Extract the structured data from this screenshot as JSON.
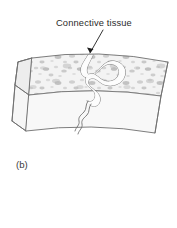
{
  "figure": {
    "caption": "(b)",
    "annotation_label": "Connective tissue",
    "alt_description": "Cutaway three-dimensional block of tissue showing a speckled upper layer with a wavy connective tissue strand passing through it",
    "colors": {
      "background": "#ffffff",
      "outline": "#6f6f6f",
      "leader": "#1e1e1e",
      "label_text": "#2b2b2b",
      "caption_text": "#3a3a3a",
      "top_face_fill": "#f2f2f2",
      "front_face_fill": "#fafafa",
      "side_face_fill": "#f6f6f6",
      "speckle_light": "#d8d8d8",
      "speckle_mid": "#c4c4c4",
      "speckle_dark": "#b0b0b0",
      "strand_stroke": "#6a6a6a",
      "strand_fill": "#fdfdfd"
    }
  }
}
